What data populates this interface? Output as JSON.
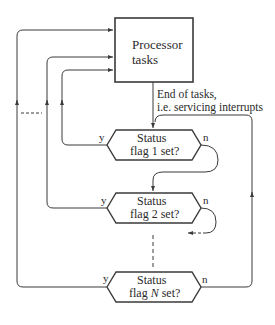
{
  "diagram": {
    "type": "flowchart",
    "process_box": {
      "line1": "Processor",
      "line2": "tasks"
    },
    "annotation": {
      "line1": "End of tasks,",
      "line2": "i.e. servicing interrupts"
    },
    "decisions": [
      {
        "line1": "Status",
        "line2": "flag 1 set?",
        "yes": "y",
        "no": "n"
      },
      {
        "line1": "Status",
        "line2": "flag 2 set?",
        "yes": "y",
        "no": "n"
      },
      {
        "line1": "Status",
        "line2_pre": "flag ",
        "line2_var": "N",
        "line2_post": " set?",
        "yes": "y",
        "no": "n"
      }
    ],
    "colors": {
      "line": "#3a3a3a",
      "text": "#2a2a2a",
      "background": "#ffffff"
    }
  }
}
